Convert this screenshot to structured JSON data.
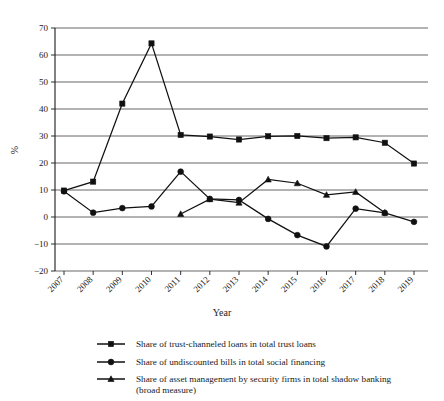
{
  "chart_data": {
    "type": "line",
    "title": "",
    "xlabel": "Year",
    "ylabel": "%",
    "categories": [
      "2007",
      "2008",
      "2009",
      "2010",
      "2011",
      "2012",
      "2013",
      "2014",
      "2015",
      "2016",
      "2017",
      "2018",
      "2019"
    ],
    "x": [
      2007,
      2008,
      2009,
      2010,
      2011,
      2012,
      2013,
      2014,
      2015,
      2016,
      2017,
      2018,
      2019
    ],
    "ylim": [
      -20,
      70
    ],
    "yticks": [
      -20,
      -10,
      0,
      10,
      20,
      30,
      40,
      50,
      60,
      70
    ],
    "ytick_labels": [
      "−20",
      "−10",
      "0",
      "10",
      "20",
      "30",
      "40",
      "50",
      "60",
      "70"
    ],
    "grid": true,
    "legend_position": "bottom",
    "series": [
      {
        "name": "Share of trust-channeled loans in total trust loans",
        "marker": "square",
        "values": [
          9.8,
          13.1,
          42.0,
          64.3,
          30.4,
          29.8,
          28.7,
          29.9,
          30.0,
          29.2,
          29.5,
          27.5,
          19.8
        ]
      },
      {
        "name": "Share of undiscounted bills in total social financing",
        "marker": "circle",
        "values": [
          9.5,
          1.6,
          3.3,
          3.9,
          16.8,
          6.7,
          6.3,
          -0.7,
          -6.7,
          -10.9,
          3.1,
          1.5,
          -1.8
        ]
      },
      {
        "name": "Share of asset management by security firms in total shadow banking (broad measure)",
        "marker": "triangle",
        "values": [
          null,
          null,
          null,
          null,
          1.1,
          6.6,
          5.3,
          13.9,
          12.5,
          8.2,
          9.3,
          1.6,
          null
        ]
      }
    ]
  },
  "legend": {
    "items": [
      {
        "label": "Share of trust-channeled loans in total trust loans",
        "marker": "square"
      },
      {
        "label": "Share of undiscounted bills in total social financing",
        "marker": "circle"
      },
      {
        "label": "Share of asset management by security firms in total shadow banking",
        "label2": "(broad measure)",
        "marker": "triangle"
      }
    ]
  },
  "colors": {
    "ink": "#111111",
    "grid": "#555555",
    "background": "#ffffff"
  }
}
